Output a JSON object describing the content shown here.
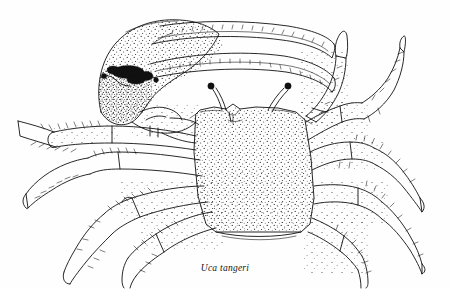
{
  "figure": {
    "caption": "Uca tangeri",
    "caption_x": 255,
    "caption_y": 263,
    "style": "pen-and-ink scientific line illustration with stipple shading",
    "background_color": "#fefefe",
    "ink_color": "#111111",
    "width": 450,
    "height": 289
  },
  "anatomy": {
    "major_cheliped": {
      "label": "major cheliped",
      "side": "left",
      "parts": [
        "propodus palm",
        "fixed finger (pollex)",
        "dactyl (movable finger)",
        "carpus",
        "merus"
      ],
      "texture": "dense stipple with dark tubercle patch at palm base",
      "dark_patch_name": "gape tubercle patch"
    },
    "carapace": {
      "label": "carapace",
      "shape": "trapezoidal, wider anteriorly",
      "texture": "fine even stipple"
    },
    "eyestalks": {
      "label": "eyestalks",
      "count": 2,
      "description": "long slender stalks with dark terminal corneas"
    },
    "walking_legs": {
      "label": "walking legs",
      "pairs": 4,
      "segments": [
        "merus",
        "carpus",
        "propodus",
        "dactylus"
      ],
      "texture": "stippled with marginal setae"
    },
    "minor_cheliped": {
      "label": "minor cheliped",
      "side": "right"
    }
  }
}
